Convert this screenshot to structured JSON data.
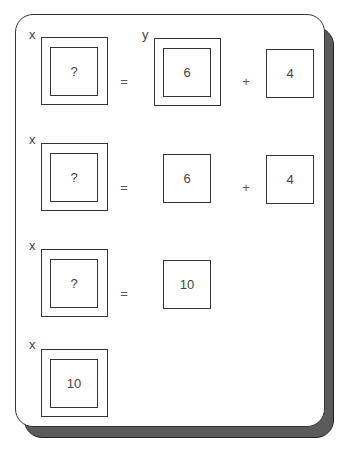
{
  "diagram": {
    "rows": [
      {
        "lhs": {
          "var": "x",
          "value": "?"
        },
        "op1": "=",
        "term1": {
          "var": "y",
          "value": "6",
          "boxed_variable": true
        },
        "op2": "+",
        "term2": {
          "value": "4"
        }
      },
      {
        "lhs": {
          "var": "x",
          "value": "?"
        },
        "op1": "=",
        "term1": {
          "value": "6"
        },
        "op2": "+",
        "term2": {
          "value": "4"
        }
      },
      {
        "lhs": {
          "var": "x",
          "value": "?"
        },
        "op1": "=",
        "term1": {
          "value": "10"
        }
      },
      {
        "lhs": {
          "var": "x",
          "value": "10"
        }
      }
    ]
  },
  "colors": {
    "stroke": "#333333",
    "shadow": "#5a5a5a",
    "background": "#ffffff"
  }
}
